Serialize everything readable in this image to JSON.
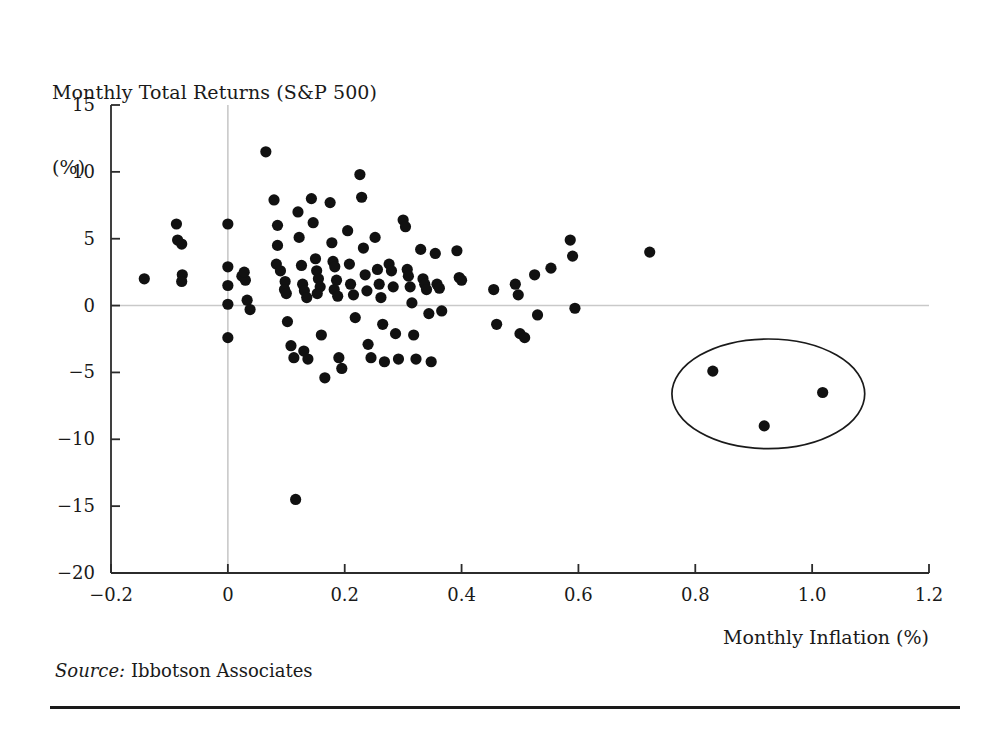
{
  "figure": {
    "y_axis_title_line1": "Monthly Total Returns (S&P 500)",
    "y_axis_title_line2": "(%)",
    "x_axis_title": "Monthly Inflation (%)",
    "source_prefix": "Source:",
    "source_value": "Ibbotson Associates",
    "colors": {
      "point": "#111111",
      "axis": "#2b2b2b",
      "gridline": "#c9c9c9",
      "annotation": "#1a1a1a",
      "background": "#ffffff"
    }
  },
  "chart_data": {
    "type": "scatter",
    "title": "Monthly Total Returns (S&P 500) (%)",
    "xlabel": "Monthly Inflation (%)",
    "ylabel": "Monthly Total Returns (S&P 500) (%)",
    "xlim": [
      -0.2,
      1.2
    ],
    "ylim": [
      -20,
      15
    ],
    "xticks": [
      -0.2,
      0,
      0.2,
      0.4,
      0.6,
      0.8,
      1.0,
      1.2
    ],
    "xticklabels": [
      "−0.2",
      "0",
      "0.2",
      "0.4",
      "0.6",
      "0.8",
      "1.0",
      "1.2"
    ],
    "yticks": [
      15,
      10,
      5,
      0,
      -5,
      -10,
      -15,
      -20
    ],
    "yticklabels": [
      "15",
      "10",
      "5",
      "0",
      "−5",
      "−10",
      "−15",
      "−20"
    ],
    "grid": "zero-lines-only",
    "legend": null,
    "points": [
      [
        -0.143,
        2.0
      ],
      [
        -0.088,
        6.1
      ],
      [
        -0.086,
        4.9
      ],
      [
        -0.079,
        4.6
      ],
      [
        -0.078,
        2.3
      ],
      [
        -0.079,
        1.8
      ],
      [
        0.0,
        6.1
      ],
      [
        0.0,
        2.9
      ],
      [
        0.0,
        1.5
      ],
      [
        0.0,
        0.1
      ],
      [
        0.0,
        -2.4
      ],
      [
        0.024,
        2.2
      ],
      [
        0.03,
        1.9
      ],
      [
        0.028,
        2.5
      ],
      [
        0.033,
        0.4
      ],
      [
        0.038,
        -0.3
      ],
      [
        0.065,
        11.5
      ],
      [
        0.079,
        7.9
      ],
      [
        0.085,
        6.0
      ],
      [
        0.085,
        4.5
      ],
      [
        0.083,
        3.1
      ],
      [
        0.09,
        2.6
      ],
      [
        0.098,
        1.8
      ],
      [
        0.097,
        1.2
      ],
      [
        0.1,
        0.9
      ],
      [
        0.102,
        -1.2
      ],
      [
        0.108,
        -3.0
      ],
      [
        0.113,
        -3.9
      ],
      [
        0.116,
        -14.5
      ],
      [
        0.12,
        7.0
      ],
      [
        0.122,
        5.1
      ],
      [
        0.126,
        3.0
      ],
      [
        0.128,
        1.6
      ],
      [
        0.131,
        1.1
      ],
      [
        0.135,
        0.6
      ],
      [
        0.13,
        -3.4
      ],
      [
        0.137,
        -4.0
      ],
      [
        0.143,
        8.0
      ],
      [
        0.146,
        6.2
      ],
      [
        0.15,
        3.5
      ],
      [
        0.152,
        2.6
      ],
      [
        0.155,
        2.0
      ],
      [
        0.158,
        1.4
      ],
      [
        0.153,
        0.9
      ],
      [
        0.16,
        -2.2
      ],
      [
        0.166,
        -5.4
      ],
      [
        0.175,
        7.7
      ],
      [
        0.178,
        4.7
      ],
      [
        0.18,
        3.3
      ],
      [
        0.183,
        2.9
      ],
      [
        0.186,
        1.9
      ],
      [
        0.182,
        1.2
      ],
      [
        0.188,
        0.7
      ],
      [
        0.19,
        -3.9
      ],
      [
        0.195,
        -4.7
      ],
      [
        0.205,
        5.6
      ],
      [
        0.208,
        3.1
      ],
      [
        0.21,
        1.6
      ],
      [
        0.215,
        0.8
      ],
      [
        0.218,
        -0.9
      ],
      [
        0.226,
        9.8
      ],
      [
        0.229,
        8.1
      ],
      [
        0.232,
        4.3
      ],
      [
        0.235,
        2.3
      ],
      [
        0.238,
        1.1
      ],
      [
        0.24,
        -2.9
      ],
      [
        0.245,
        -3.9
      ],
      [
        0.252,
        5.1
      ],
      [
        0.256,
        2.7
      ],
      [
        0.259,
        1.6
      ],
      [
        0.262,
        0.6
      ],
      [
        0.265,
        -1.4
      ],
      [
        0.268,
        -4.2
      ],
      [
        0.276,
        3.1
      ],
      [
        0.28,
        2.6
      ],
      [
        0.283,
        1.4
      ],
      [
        0.287,
        -2.1
      ],
      [
        0.292,
        -4.0
      ],
      [
        0.3,
        6.4
      ],
      [
        0.304,
        5.9
      ],
      [
        0.307,
        2.7
      ],
      [
        0.309,
        2.2
      ],
      [
        0.312,
        1.4
      ],
      [
        0.315,
        0.2
      ],
      [
        0.318,
        -2.2
      ],
      [
        0.322,
        -4.0
      ],
      [
        0.33,
        4.2
      ],
      [
        0.334,
        2.0
      ],
      [
        0.337,
        1.6
      ],
      [
        0.34,
        1.2
      ],
      [
        0.344,
        -0.6
      ],
      [
        0.348,
        -4.2
      ],
      [
        0.355,
        3.9
      ],
      [
        0.358,
        1.6
      ],
      [
        0.362,
        1.3
      ],
      [
        0.366,
        -0.4
      ],
      [
        0.392,
        4.1
      ],
      [
        0.396,
        2.1
      ],
      [
        0.4,
        1.9
      ],
      [
        0.455,
        1.2
      ],
      [
        0.46,
        -1.4
      ],
      [
        0.492,
        1.6
      ],
      [
        0.497,
        0.8
      ],
      [
        0.5,
        -2.1
      ],
      [
        0.508,
        -2.4
      ],
      [
        0.525,
        2.3
      ],
      [
        0.53,
        -0.7
      ],
      [
        0.553,
        2.8
      ],
      [
        0.586,
        4.9
      ],
      [
        0.59,
        3.7
      ],
      [
        0.594,
        -0.2
      ],
      [
        0.722,
        4.0
      ],
      [
        0.83,
        -4.9
      ],
      [
        0.918,
        -9.0
      ],
      [
        1.018,
        -6.5
      ]
    ],
    "annotations": [
      {
        "type": "ellipse",
        "name": "outlier-highlight-ellipse",
        "center_x": 0.925,
        "center_y": -6.6,
        "radius_x": 0.165,
        "radius_y": 4.1,
        "encloses_points": 3
      }
    ],
    "source": "Ibbotson Associates"
  }
}
